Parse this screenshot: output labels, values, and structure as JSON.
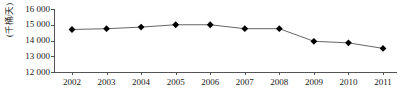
{
  "chart_data": {
    "type": "line",
    "title": "",
    "subtitle": "",
    "xlabel": "",
    "ylabel": "(千桶/天)",
    "categories": [
      "2002",
      "2003",
      "2004",
      "2005",
      "2006",
      "2007",
      "2008",
      "2009",
      "2010",
      "2011"
    ],
    "x": [
      2002,
      2003,
      2004,
      2005,
      2006,
      2007,
      2008,
      2009,
      2010,
      2011
    ],
    "values": [
      14700,
      14750,
      14850,
      15000,
      15000,
      14750,
      14750,
      13950,
      13850,
      13500
    ],
    "series": [
      {
        "name": "",
        "values": [
          14700,
          14750,
          14850,
          15000,
          15000,
          14750,
          14750,
          13950,
          13850,
          13500
        ]
      }
    ],
    "ylim": [
      12000,
      16000
    ],
    "ytick_values": [
      12000,
      13000,
      14000,
      15000,
      16000
    ],
    "ytick_labels": [
      "12 000",
      "13 000",
      "14 000",
      "15 000",
      "16 000"
    ],
    "xtick_labels": [
      "2002",
      "2003",
      "2004",
      "2005",
      "2006",
      "2007",
      "2008",
      "2009",
      "2010",
      "2011"
    ],
    "grid": false,
    "legend": false,
    "legend_position": "none",
    "marker": "diamond",
    "marker_color": "#000000",
    "line_color": "#666666",
    "axis_color": "#555555",
    "background_color": "#ffffff",
    "annotations": []
  }
}
